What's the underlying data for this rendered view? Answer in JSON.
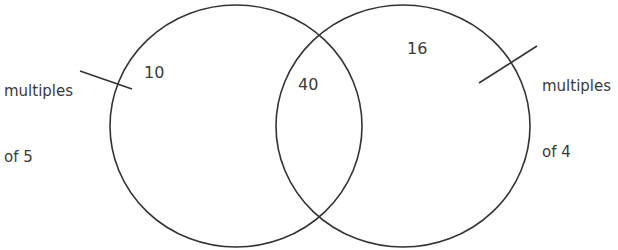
{
  "diagram": {
    "type": "venn",
    "sets": [
      {
        "label_line1": "multiples",
        "label_line2": "of 5",
        "only_value": "10"
      },
      {
        "label_line1": "multiples",
        "label_line2": "of 4",
        "only_value": "16"
      }
    ],
    "intersection_value": "40",
    "stroke_color": "#333333"
  }
}
